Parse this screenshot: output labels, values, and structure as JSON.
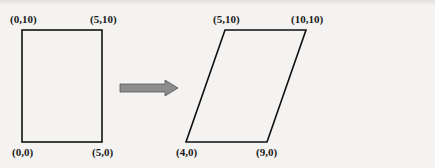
{
  "diagram": {
    "type": "geometric-transformation",
    "arrow_color": "#8c8c8c",
    "source_shape": {
      "name": "rectangle",
      "vertices": [
        {
          "label": "(0,10)",
          "x": 0,
          "y": 10
        },
        {
          "label": "(5,10)",
          "x": 5,
          "y": 10
        },
        {
          "label": "(0,0)",
          "x": 0,
          "y": 0
        },
        {
          "label": "(5,0)",
          "x": 5,
          "y": 0
        }
      ]
    },
    "target_shape": {
      "name": "parallelogram",
      "vertices": [
        {
          "label": "(5,10)",
          "x": 5,
          "y": 10
        },
        {
          "label": "(10,10)",
          "x": 10,
          "y": 10
        },
        {
          "label": "(4,0)",
          "x": 4,
          "y": 0
        },
        {
          "label": "(9,0)",
          "x": 9,
          "y": 0
        }
      ]
    }
  }
}
